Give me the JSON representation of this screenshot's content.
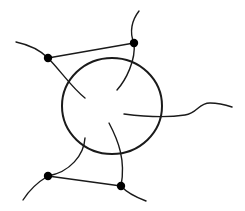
{
  "diagram": {
    "title": "",
    "colors": {
      "stroke": "#1a1a1a",
      "background": "#ffffff",
      "dot": "#000000"
    },
    "circle": {
      "cx": 112,
      "cy": 106,
      "rx": 50,
      "ry": 48
    },
    "vertices": [
      {
        "id": "top-left",
        "x": 48,
        "y": 58
      },
      {
        "id": "top-right",
        "x": 134,
        "y": 43
      },
      {
        "id": "bottom-left",
        "x": 48,
        "y": 176
      },
      {
        "id": "bottom-right",
        "x": 121,
        "y": 186
      }
    ],
    "edges": [
      {
        "from": "top-left",
        "to": "top-right"
      },
      {
        "from": "bottom-left",
        "to": "bottom-right"
      }
    ],
    "strands": [
      {
        "id": "strand-top-left",
        "d": "M16,42 C30,45 40,50 48,58 C60,70 72,88 85,98"
      },
      {
        "id": "strand-top-right",
        "d": "M139,11 C132,20 129,32 134,43 C136,60 126,80 117,90"
      },
      {
        "id": "strand-right",
        "d": "M124,114 C140,116 165,118 185,115 C198,113 198,103 210,103 C218,103 226,105 232,107"
      },
      {
        "id": "strand-bottom-left",
        "d": "M85,138 C84,155 70,172 48,176 C38,182 28,192 23,200"
      },
      {
        "id": "strand-bottom-right",
        "d": "M109,123 C118,140 126,160 121,186 C128,194 138,198 146,201"
      }
    ]
  }
}
